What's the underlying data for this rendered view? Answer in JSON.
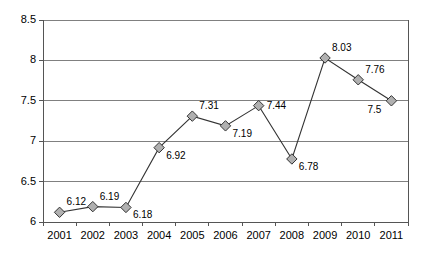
{
  "chart_data": {
    "type": "line",
    "title": "",
    "subtitle": "",
    "xlabel": "",
    "ylabel": "",
    "categories": [
      "2001",
      "2002",
      "2003",
      "2004",
      "2005",
      "2006",
      "2007",
      "2008",
      "2009",
      "2010",
      "2011"
    ],
    "values": [
      6.12,
      6.19,
      6.18,
      6.92,
      7.31,
      7.19,
      7.44,
      6.78,
      8.03,
      7.76,
      7.5
    ],
    "data_labels": [
      "6.12",
      "6.19",
      "6.18",
      "6.92",
      "7.31",
      "7.19",
      "7.44",
      "6.78",
      "8.03",
      "7.76",
      "7.5"
    ],
    "label_positions": [
      "above-right",
      "above-right",
      "below-right",
      "below-right",
      "above-right",
      "below-right",
      "right",
      "below-right",
      "above-right",
      "above-right",
      "below-left"
    ],
    "ylim": [
      6,
      8.5
    ],
    "yticks": [
      6,
      6.5,
      7,
      7.5,
      8,
      8.5
    ],
    "ytick_labels": [
      "6",
      "6.5",
      "7",
      "7.5",
      "8",
      "8.5"
    ],
    "grid": {
      "horizontal": true,
      "vertical": false,
      "color": "#808080"
    },
    "legend": {
      "visible": false,
      "position": "none",
      "entries": []
    },
    "series": [
      {
        "name": "series-1",
        "values": [
          6.12,
          6.19,
          6.18,
          6.92,
          7.31,
          7.19,
          7.44,
          6.78,
          8.03,
          7.76,
          7.5
        ],
        "line_color": "#333333",
        "marker": "diamond",
        "marker_fill": "#b0b0b0",
        "marker_edge": "#333333"
      }
    ],
    "axis_color": "#555555",
    "plot_background": "#ffffff",
    "annotations": []
  }
}
